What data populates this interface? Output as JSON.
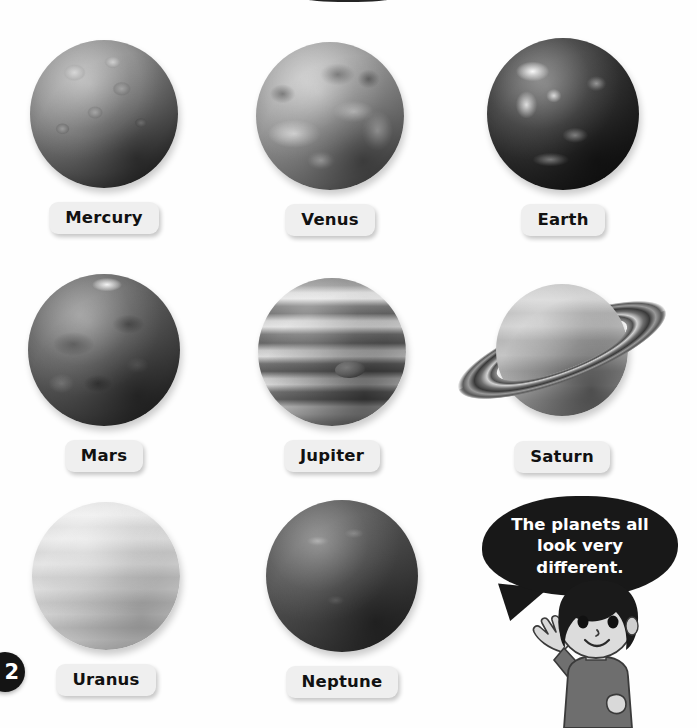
{
  "page": {
    "background_color": "#fefefe",
    "page_number": "2",
    "top_cutoff_heading_visible": true
  },
  "planets": [
    {
      "name": "Mercury",
      "label": "Mercury",
      "row": 1,
      "column": 1,
      "x": 30,
      "y": 40,
      "size": 148,
      "appearance": "cratered gray sphere, dark shadowed lower edge"
    },
    {
      "name": "Venus",
      "label": "Venus",
      "row": 1,
      "column": 2,
      "x": 256,
      "y": 42,
      "size": 148,
      "appearance": "mottled gray with bright white swirling cloud bands"
    },
    {
      "name": "Earth",
      "label": "Earth",
      "row": 1,
      "column": 3,
      "x": 487,
      "y": 38,
      "size": 152,
      "appearance": "dark sphere with bright white cloud systems and landmasses"
    },
    {
      "name": "Mars",
      "label": "Mars",
      "row": 2,
      "column": 1,
      "x": 28,
      "y": 274,
      "size": 152,
      "appearance": "dark gray with surface markings and bright polar cap"
    },
    {
      "name": "Jupiter",
      "label": "Jupiter",
      "row": 2,
      "column": 2,
      "x": 258,
      "y": 278,
      "size": 148,
      "appearance": "horizontal light and dark cloud bands with Great Red Spot"
    },
    {
      "name": "Saturn",
      "label": "Saturn",
      "row": 2,
      "column": 3,
      "x": 452,
      "y": 262,
      "size": 132,
      "appearance": "light gray banded sphere with tilted ring system"
    },
    {
      "name": "Uranus",
      "label": "Uranus",
      "row": 3,
      "column": 1,
      "x": 32,
      "y": 502,
      "size": 148,
      "appearance": "pale light gray sphere with faint horizontal banding"
    },
    {
      "name": "Neptune",
      "label": "Neptune",
      "row": 3,
      "column": 2,
      "x": 266,
      "y": 500,
      "size": 152,
      "appearance": "dark charcoal gray sphere with faint bright streaks"
    }
  ],
  "speech_bubble": {
    "line1": "The planets all",
    "line2": "look very different.",
    "full_text": "The planets all look very different.",
    "background_color": "#181818",
    "text_color": "#ffffff"
  },
  "character": {
    "description": "cartoon boy waving",
    "hair_color": "#1a1a1a",
    "skin_color": "#d9d9d9",
    "shirt_color": "#6e6e6e"
  },
  "labels": {
    "pill_background": "#efefef",
    "pill_text_color": "#111111"
  }
}
